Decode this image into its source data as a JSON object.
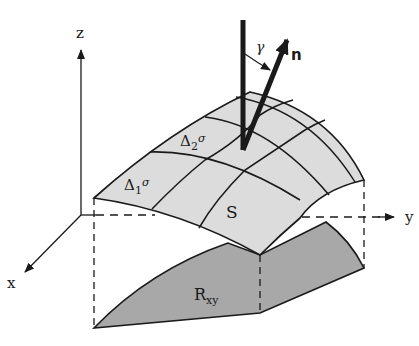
{
  "diagram": {
    "type": "surface-integral-projection",
    "axes": {
      "x_label": "x",
      "y_label": "y",
      "z_label": "z"
    },
    "surface": {
      "label": "S",
      "patch1_label": "Δ",
      "patch1_sub": "1",
      "patch1_sup": "σ",
      "patch2_label": "Δ",
      "patch2_sub": "2",
      "patch2_sup": "σ"
    },
    "region": {
      "label": "R",
      "sub": "xy"
    },
    "normal": {
      "label": "n",
      "angle_label": "γ"
    },
    "colors": {
      "surface_fill": "#dcdcdc",
      "region_fill": "#a8a8a8",
      "ink": "#1a1a1a",
      "background": "#ffffff"
    }
  }
}
